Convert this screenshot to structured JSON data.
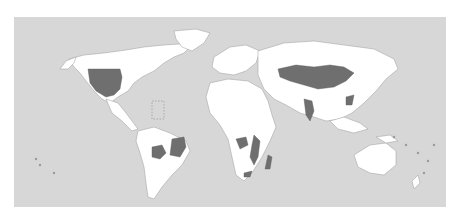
{
  "map": {
    "type": "choropleth-world-map",
    "colors": {
      "ocean": "#d7d7d7",
      "land": "#ffffff",
      "border": "#9a9a9a",
      "highlighted": "#6f6f6f",
      "page_background": "#ffffff"
    },
    "legend": null,
    "labels": [],
    "highlighted_regions": [
      "United States (contiguous west/central)",
      "Bolivia",
      "Eastern Brazil",
      "Central Asia / Kazakhstan",
      "Western and Northern China",
      "Mongolia",
      "Western and Southern India",
      "Southeast China",
      "Central Africa (DR Congo area)",
      "East Africa (Tanzania/Mozambique/Malawi area)",
      "Madagascar",
      "South Africa (northeast)"
    ]
  }
}
